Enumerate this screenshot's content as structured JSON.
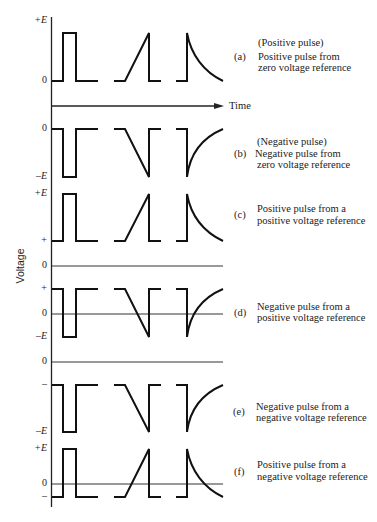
{
  "figure": {
    "y_axis_label": "Voltage",
    "time_axis_label": "Time",
    "waveform_types": [
      "rectangular-pulse",
      "sawtooth-ramp",
      "exponential-spike"
    ]
  },
  "rows": [
    {
      "letter": "(a)",
      "heading": "(Positive pulse)",
      "caption": [
        "Positive pulse from",
        "zero voltage reference"
      ],
      "ticks": [
        "+E",
        "0"
      ]
    },
    {
      "letter": "(b)",
      "heading": "(Negative pulse)",
      "caption": [
        "Negative pulse from",
        "zero voltage reference"
      ],
      "ticks": [
        "0",
        "–E"
      ]
    },
    {
      "letter": "(c)",
      "caption": [
        "Positive pulse from a",
        "positive voltage reference"
      ],
      "ticks": [
        "+E",
        "+",
        "0"
      ]
    },
    {
      "letter": "(d)",
      "caption": [
        "Negative pulse from a",
        "positive voltage reference"
      ],
      "ticks": [
        "+",
        "0",
        "–E"
      ]
    },
    {
      "letter": "(e)",
      "caption": [
        "Negative pulse from a",
        "negative voltage reference"
      ],
      "ticks": [
        "0",
        "–",
        "–E"
      ]
    },
    {
      "letter": "(f)",
      "caption": [
        "Positive pulse from a",
        "negative voltage reference"
      ],
      "ticks": [
        "+E",
        "0",
        "–"
      ]
    }
  ]
}
